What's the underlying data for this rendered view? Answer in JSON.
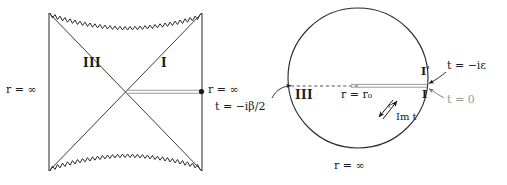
{
  "figure": {
    "type": "diagram",
    "panels": [
      {
        "name": "penrose-diagram",
        "shape": "square-with-zigzag-singularities",
        "regions": [
          {
            "id": "III",
            "label": "III",
            "position": "left-wedge"
          },
          {
            "id": "I",
            "label": "I",
            "position": "right-wedge"
          }
        ],
        "labels": {
          "left_infinity": "r = ∞",
          "right_infinity": "r = ∞",
          "time_slice": "t = −iβ/2"
        },
        "features": {
          "cut_line_color": "#9a9a9a",
          "endpoint_dot": true,
          "diagonals": 2,
          "zigzag_edges": [
            "top",
            "bottom"
          ]
        }
      },
      {
        "name": "euclidean-section",
        "shape": "circle",
        "regions": [
          {
            "id": "III",
            "label": "III",
            "position": "left"
          },
          {
            "id": "Iprime",
            "label": "Iʹ",
            "position": "right-above-cut"
          },
          {
            "id": "I",
            "label": "I",
            "position": "right-below-cut"
          }
        ],
        "labels": {
          "origin": "r = r₀",
          "imaginary_time_axis": "Im t",
          "radial_axis": "r",
          "outer_infinity": "r = ∞",
          "epsilon_time": "t = −iε",
          "zero_time": "t = 0",
          "half_beta_time": "t = −iβ/2"
        },
        "features": {
          "dashed_line_color": "#555555",
          "cut_line_color": "#9a9a9a",
          "grey_label_color": "#9a9a9a"
        }
      }
    ]
  },
  "colors": {
    "ink": "#1a1a1a",
    "grey": "#9a9a9a",
    "background": "#ffffff"
  }
}
